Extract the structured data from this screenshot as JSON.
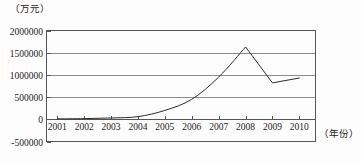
{
  "chart_data": {
    "type": "line",
    "title": "",
    "subtitle": "",
    "xlabel": "（年份）",
    "ylabel": "（万元）",
    "x": [
      2001,
      2002,
      2003,
      2004,
      2005,
      2006,
      2007,
      2008,
      2009,
      2010
    ],
    "categories": [
      "2001",
      "2002",
      "2003",
      "2004",
      "2005",
      "2006",
      "2007",
      "2008",
      "2009",
      "2010"
    ],
    "series": [
      {
        "name": "金额",
        "values": [
          10000,
          15000,
          30000,
          60000,
          200000,
          450000,
          950000,
          1630000,
          820000,
          930000
        ]
      }
    ],
    "xlim": [
      2000.6,
      2010.6
    ],
    "ylim": [
      -500000,
      2000000
    ],
    "yticks": [
      2000000,
      1500000,
      1000000,
      500000,
      0,
      -500000
    ],
    "ytick_labels": [
      "2000000",
      "1500000",
      "1000000",
      "500000",
      "0",
      "-500000"
    ],
    "xticks": [
      2001,
      2002,
      2003,
      2004,
      2005,
      2006,
      2007,
      2008,
      2009,
      2010
    ],
    "xtick_labels": [
      "2001",
      "2002",
      "2003",
      "2004",
      "2005",
      "2006",
      "2007",
      "2008",
      "2009",
      "2010"
    ],
    "grid": true,
    "grid_axis": "y",
    "legend": false,
    "legend_position": "none",
    "line_color": "#2b2b2b",
    "grid_color": "#8c8c8c",
    "frame_color": "#555555",
    "background_color": "#ffffff",
    "annotations": []
  },
  "axis": {
    "y_unit_caption": "（万元）",
    "x_name_caption": "（年份）"
  }
}
